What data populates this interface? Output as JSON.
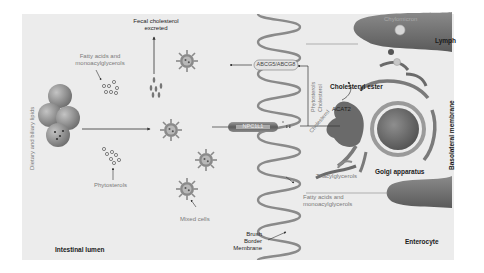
{
  "diagram": {
    "regions": {
      "lumen": "Intestinal lumen",
      "enterocyte": "Enterocyte",
      "lymph": "Lymph",
      "basolateral": "Basolateral membrane",
      "brush_border": [
        "Brush",
        "Border",
        "Membrane"
      ]
    },
    "lumen_labels": {
      "dietary": "Dietary and biliary lipids",
      "fatty_acids": [
        "Fatty acids and",
        "monoacylglycerols"
      ],
      "fecal": [
        "Fecal cholesterol",
        "excreted"
      ],
      "phytosterols": "Phytosterols",
      "mixed_cells": "Mixed cells"
    },
    "transporters": {
      "efflux": "ABCG5/ABCG8",
      "influx": "NPC1L1"
    },
    "enterocyte_labels": {
      "phytosterols": "Phytosterols",
      "cholesterol_up": "Cholesterol",
      "cholesterol_in": "Cholesterol",
      "cholesteryl_ester": "Cholesteryl ester",
      "acat2": "ACAT2",
      "golgi": "Golgi apparatus",
      "triacylglycerols": "Triacylglycerols",
      "fatty_acids": [
        "Fatty acids and",
        "monoacylglycerols"
      ],
      "chylomicron": "Chylomicron"
    },
    "colors": {
      "panel": "#ececec",
      "membrane": "#8a8a8a",
      "organelle": "#6b6b6b",
      "nucleus": "#707070",
      "lymph_vessel": "#6e6e6e",
      "text_gray": "#7a7a7a",
      "text_dark": "#1a1a1a"
    }
  }
}
